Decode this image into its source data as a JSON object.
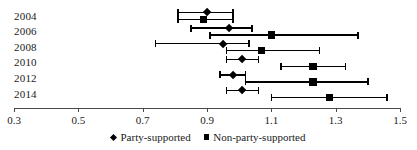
{
  "chart_data": {
    "type": "scatter",
    "subtype": "forest-plot-with-confidence-intervals",
    "title": "",
    "xlabel": "",
    "ylabel": "",
    "categories": [
      "2004",
      "2006",
      "2008",
      "2010",
      "2012",
      "2014"
    ],
    "xlim": [
      0.3,
      1.5
    ],
    "xticks": [
      "0.3",
      "0.5",
      "0.7",
      "0.9",
      "1.1",
      "1.3",
      "1.5"
    ],
    "xtick_values": [
      0.3,
      0.5,
      0.7,
      0.9,
      1.1,
      1.3,
      1.5
    ],
    "grid": false,
    "legend_position": "bottom-center",
    "series": [
      {
        "name": "Party-supported",
        "marker": "diamond",
        "color": "#000000",
        "values": [
          0.9,
          0.97,
          0.95,
          1.01,
          0.98,
          1.01
        ],
        "ci_low": [
          0.81,
          0.85,
          0.74,
          0.96,
          0.94,
          0.96
        ],
        "ci_high": [
          0.98,
          1.04,
          1.03,
          1.06,
          1.02,
          1.06
        ]
      },
      {
        "name": "Non-party-supported",
        "marker": "square",
        "color": "#000000",
        "values": [
          0.89,
          1.1,
          1.07,
          1.23,
          1.23,
          1.28
        ],
        "ci_low": [
          0.81,
          0.91,
          0.96,
          1.13,
          1.02,
          1.1
        ],
        "ci_high": [
          0.98,
          1.37,
          1.25,
          1.33,
          1.4,
          1.46
        ]
      }
    ]
  },
  "legend": {
    "items": [
      {
        "label": "Party-supported",
        "marker": "diamond"
      },
      {
        "label": "Non-party-supported",
        "marker": "square"
      }
    ]
  },
  "layout": {
    "axis_left_px": 14,
    "axis_right_px": 400,
    "row_top_px": 16,
    "row_step_px": 15.6,
    "label_left_px": 14,
    "series_offset_px": [
      -3.5,
      3.5
    ]
  }
}
